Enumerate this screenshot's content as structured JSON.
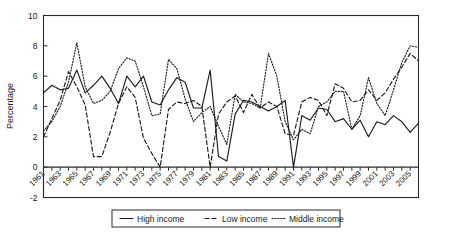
{
  "chart_data": {
    "type": "line",
    "title": "",
    "xlabel": "",
    "ylabel": "Percentage",
    "ylim": [
      -2,
      10
    ],
    "xlim": [
      1961,
      2006
    ],
    "yticks": [
      -2,
      0,
      2,
      4,
      6,
      8,
      10
    ],
    "ytick_labels": [
      "-2",
      "0",
      "2",
      "4",
      "6",
      "8",
      "10"
    ],
    "grid": false,
    "legend_position": "below-center",
    "x": [
      1961,
      1962,
      1963,
      1964,
      1965,
      1966,
      1967,
      1968,
      1969,
      1970,
      1971,
      1972,
      1973,
      1974,
      1975,
      1976,
      1977,
      1978,
      1979,
      1980,
      1981,
      1982,
      1983,
      1984,
      1985,
      1986,
      1987,
      1988,
      1989,
      1990,
      1991,
      1992,
      1993,
      1994,
      1995,
      1996,
      1997,
      1998,
      1999,
      2000,
      2001,
      2002,
      2003,
      2004,
      2005,
      2006
    ],
    "xtick_labels": [
      "1961",
      "1963",
      "1965",
      "1967",
      "1969",
      "1971",
      "1973",
      "1975",
      "1977",
      "1979",
      "1981",
      "1983",
      "1985",
      "1987",
      "1989",
      "1991",
      "1993",
      "1995",
      "1997",
      "1999",
      "2001",
      "2003",
      "2005"
    ],
    "series": [
      {
        "name": "High income",
        "style": "solid",
        "values": [
          4.9,
          5.4,
          5.1,
          5.2,
          6.4,
          4.9,
          5.4,
          6.0,
          5.2,
          4.2,
          6.0,
          5.3,
          6.0,
          4.3,
          4.1,
          5.1,
          5.9,
          5.6,
          3.9,
          3.9,
          6.4,
          0.7,
          0.4,
          3.5,
          4.4,
          4.3,
          4.0,
          3.7,
          4.0,
          4.4,
          0.0,
          3.4,
          3.1,
          3.9,
          3.8,
          3.0,
          3.2,
          2.5,
          3.1,
          2.0,
          3.0,
          2.8,
          3.4,
          3.0,
          2.3,
          2.9
        ]
      },
      {
        "name": "Low income",
        "style": "dashed",
        "values": [
          2.0,
          3.2,
          4.4,
          6.3,
          5.3,
          4.1,
          0.7,
          0.7,
          2.3,
          4.2,
          5.3,
          4.6,
          1.9,
          0.9,
          0.0,
          3.8,
          4.3,
          4.2,
          4.4,
          4.0,
          0.0,
          3.5,
          4.3,
          4.7,
          3.6,
          4.8,
          3.9,
          4.3,
          4.0,
          2.2,
          2.1,
          4.3,
          4.6,
          4.4,
          3.4,
          5.5,
          5.2,
          4.3,
          4.4,
          5.1,
          4.4,
          4.9,
          5.8,
          6.6,
          7.5,
          7.0
        ]
      },
      {
        "name": "Middle income",
        "style": "dotted",
        "values": [
          2.4,
          3.0,
          4.0,
          5.6,
          8.2,
          5.3,
          4.2,
          4.4,
          5.0,
          6.5,
          7.2,
          7.0,
          5.3,
          3.4,
          3.5,
          7.1,
          6.5,
          4.5,
          3.0,
          3.6,
          4.0,
          2.7,
          1.5,
          4.8,
          4.3,
          4.2,
          3.9,
          7.5,
          6.0,
          3.0,
          1.8,
          2.5,
          2.2,
          4.0,
          4.3,
          5.0,
          5.0,
          2.5,
          3.4,
          5.9,
          4.2,
          3.4,
          5.1,
          6.9,
          8.0,
          7.9
        ]
      }
    ]
  },
  "legend": {
    "items": [
      {
        "label": "High income",
        "style": "solid"
      },
      {
        "label": "Low income",
        "style": "dashed"
      },
      {
        "label": "Middle income",
        "style": "dotted"
      }
    ]
  }
}
